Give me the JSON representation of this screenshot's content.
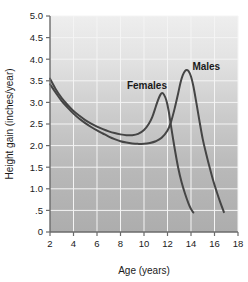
{
  "chart_data": {
    "type": "line",
    "title": "",
    "xlabel": "Age (years)",
    "ylabel": "Height gain (inches/year)",
    "xlim": [
      2,
      18
    ],
    "ylim": [
      0,
      5.0
    ],
    "grid": true,
    "legend_position": "inline-annotations",
    "x_ticks": [
      "2",
      "4",
      "6",
      "8",
      "10",
      "12",
      "14",
      "16",
      "18"
    ],
    "y_ticks": [
      "0",
      ".5",
      "1.0",
      "1.5",
      "2.0",
      "2.5",
      "3.0",
      "3.5",
      "4.0",
      "4.5",
      "5.0"
    ],
    "x_tick_values": [
      2,
      4,
      6,
      8,
      10,
      12,
      14,
      16,
      18
    ],
    "y_tick_values": [
      0,
      0.5,
      1.0,
      1.5,
      2.0,
      2.5,
      3.0,
      3.5,
      4.0,
      4.5,
      5.0
    ],
    "series": [
      {
        "name": "Females",
        "label_x": 10.25,
        "label_y": 3.3,
        "points": [
          [
            2.0,
            3.55
          ],
          [
            2.5,
            3.3
          ],
          [
            3.0,
            3.1
          ],
          [
            3.5,
            2.94
          ],
          [
            4.0,
            2.8
          ],
          [
            4.5,
            2.69
          ],
          [
            5.0,
            2.59
          ],
          [
            5.5,
            2.51
          ],
          [
            6.0,
            2.44
          ],
          [
            6.5,
            2.38
          ],
          [
            7.0,
            2.33
          ],
          [
            7.5,
            2.29
          ],
          [
            8.0,
            2.26
          ],
          [
            8.5,
            2.24
          ],
          [
            9.0,
            2.24
          ],
          [
            9.5,
            2.27
          ],
          [
            10.0,
            2.36
          ],
          [
            10.4,
            2.5
          ],
          [
            10.7,
            2.66
          ],
          [
            11.0,
            2.9
          ],
          [
            11.2,
            3.06
          ],
          [
            11.4,
            3.18
          ],
          [
            11.55,
            3.22
          ],
          [
            11.7,
            3.18
          ],
          [
            11.9,
            3.05
          ],
          [
            12.1,
            2.8
          ],
          [
            12.3,
            2.45
          ],
          [
            12.6,
            1.95
          ],
          [
            12.9,
            1.5
          ],
          [
            13.2,
            1.15
          ],
          [
            13.5,
            0.88
          ],
          [
            13.8,
            0.65
          ],
          [
            14.0,
            0.53
          ],
          [
            14.2,
            0.45
          ]
        ]
      },
      {
        "name": "Males",
        "label_x": 15.3,
        "label_y": 3.75,
        "points": [
          [
            2.0,
            3.42
          ],
          [
            2.5,
            3.22
          ],
          [
            3.0,
            3.03
          ],
          [
            3.5,
            2.88
          ],
          [
            4.0,
            2.74
          ],
          [
            4.5,
            2.62
          ],
          [
            5.0,
            2.52
          ],
          [
            5.5,
            2.43
          ],
          [
            6.0,
            2.35
          ],
          [
            6.5,
            2.28
          ],
          [
            7.0,
            2.21
          ],
          [
            7.5,
            2.15
          ],
          [
            8.0,
            2.1
          ],
          [
            8.5,
            2.07
          ],
          [
            9.0,
            2.05
          ],
          [
            9.5,
            2.04
          ],
          [
            10.0,
            2.04
          ],
          [
            10.5,
            2.06
          ],
          [
            11.0,
            2.1
          ],
          [
            11.5,
            2.18
          ],
          [
            12.0,
            2.35
          ],
          [
            12.3,
            2.55
          ],
          [
            12.6,
            2.85
          ],
          [
            12.9,
            3.2
          ],
          [
            13.1,
            3.45
          ],
          [
            13.3,
            3.63
          ],
          [
            13.5,
            3.73
          ],
          [
            13.65,
            3.75
          ],
          [
            13.8,
            3.72
          ],
          [
            14.0,
            3.6
          ],
          [
            14.2,
            3.38
          ],
          [
            14.45,
            3.0
          ],
          [
            14.7,
            2.6
          ],
          [
            15.0,
            2.15
          ],
          [
            15.3,
            1.8
          ],
          [
            15.6,
            1.48
          ],
          [
            15.9,
            1.18
          ],
          [
            16.2,
            0.92
          ],
          [
            16.5,
            0.68
          ],
          [
            16.8,
            0.46
          ]
        ]
      }
    ]
  },
  "colors": {
    "curve": "#454545",
    "axis": "#6b6b6b",
    "grid": "#f4f4f4",
    "plot_bg_top": "#eeeeee",
    "plot_bg_bottom": "#adadad",
    "text": "#1a1a1a"
  }
}
